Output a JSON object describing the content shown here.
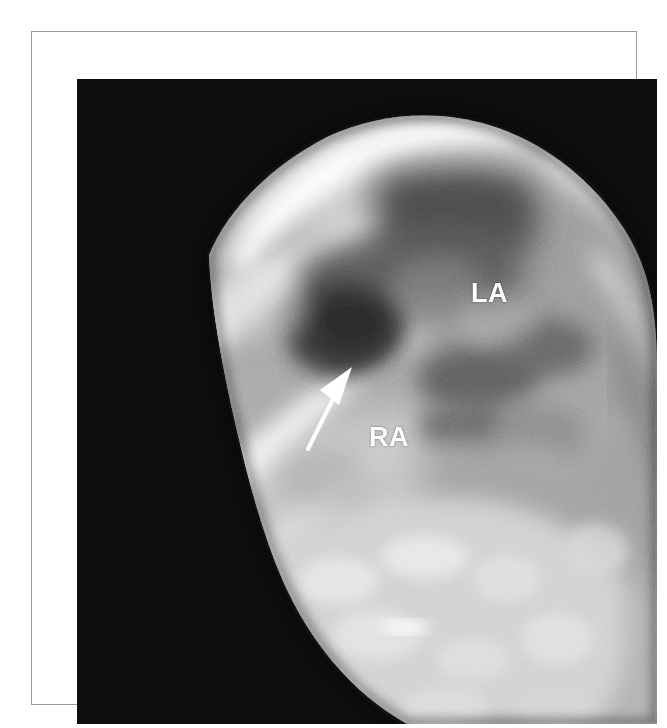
{
  "figure": {
    "modality": "echocardiogram",
    "view": "three-dimensional en-face view of the atrial septum",
    "background_color": "#ffffff",
    "frame_color": "#9a9a9a",
    "image_background_color": "#0d0d0d"
  },
  "annotations": {
    "labels": [
      {
        "id": "la",
        "text": "LA",
        "meaning": "left atrium",
        "color": "#ffffff",
        "x": 440,
        "y": 250
      },
      {
        "id": "ra",
        "text": "RA",
        "meaning": "right atrium",
        "color": "#ffffff",
        "x": 338,
        "y": 394
      }
    ],
    "arrow": {
      "id": "defect-arrow",
      "name": "atrial-septal-defect-pointer",
      "color": "#ffffff",
      "tail_x": 276,
      "tail_y": 417,
      "tip_x": 314,
      "tip_y": 343
    }
  },
  "image_regions": {
    "description": "Grayscale ultrasound tissue block on black background, oriented diagonally with bright specular rim along the superior-left margin and a dark defect aperture at centre-left.",
    "tones": {
      "black": "#0c0c0c",
      "shadow": "#2e2e2e",
      "mid_dark": "#5a5a5a",
      "mid": "#868686",
      "mid_light": "#adadad",
      "light": "#cfcfcf",
      "highlight": "#f2f2f2",
      "specular": "#ffffff"
    }
  }
}
